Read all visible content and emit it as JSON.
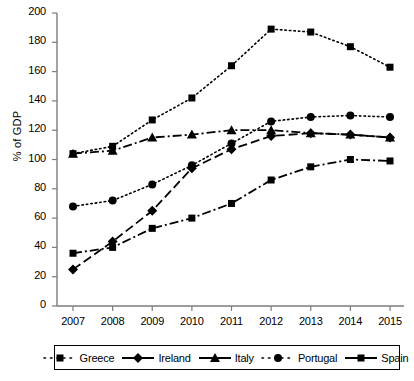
{
  "chart_data": {
    "type": "line",
    "title": "",
    "xlabel": "",
    "ylabel": "% of GDP",
    "x": [
      "2007",
      "2008",
      "2009",
      "2010",
      "2011",
      "2012",
      "2013",
      "2014",
      "2015"
    ],
    "categories": [
      "2007",
      "2008",
      "2009",
      "2010",
      "2011",
      "2012",
      "2013",
      "2014",
      "2015"
    ],
    "ylim": [
      0,
      200
    ],
    "yticks": [
      0,
      20,
      40,
      60,
      80,
      100,
      120,
      140,
      160,
      180,
      200
    ],
    "grid": false,
    "legend_position": "bottom",
    "series": [
      {
        "name": "Greece",
        "marker": "square",
        "line_style": "dotted",
        "color": "#000000",
        "values": [
          104,
          109,
          127,
          142,
          164,
          189,
          187,
          177,
          163
        ]
      },
      {
        "name": "Ireland",
        "marker": "diamond",
        "line_style": "dashed",
        "color": "#000000",
        "values": [
          25,
          44,
          65,
          94,
          107,
          116,
          118,
          117,
          115
        ]
      },
      {
        "name": "Italy",
        "marker": "triangle",
        "line_style": "dash-dot",
        "color": "#000000",
        "values": [
          104,
          106,
          115,
          117,
          120,
          120,
          118,
          117,
          115
        ]
      },
      {
        "name": "Portugal",
        "marker": "circle",
        "line_style": "dotted",
        "color": "#000000",
        "values": [
          68,
          72,
          83,
          96,
          111,
          126,
          129,
          130,
          129
        ]
      },
      {
        "name": "Spain",
        "marker": "square",
        "line_style": "dash-dot",
        "color": "#000000",
        "values": [
          36,
          40,
          53,
          60,
          70,
          86,
          95,
          100,
          99
        ]
      }
    ]
  },
  "axis": {
    "y_label": "% of GDP",
    "y_ticks": [
      "0",
      "20",
      "40",
      "60",
      "80",
      "100",
      "120",
      "140",
      "160",
      "180",
      "200"
    ],
    "x_ticks": [
      "2007",
      "2008",
      "2009",
      "2010",
      "2011",
      "2012",
      "2013",
      "2014",
      "2015"
    ]
  },
  "legend": {
    "items": [
      {
        "label": "Greece",
        "marker": "square",
        "line_style": "dotted"
      },
      {
        "label": "Ireland",
        "marker": "diamond",
        "line_style": "solid"
      },
      {
        "label": "Italy",
        "marker": "triangle",
        "line_style": "solid"
      },
      {
        "label": "Portugal",
        "marker": "circle",
        "line_style": "dotted"
      },
      {
        "label": "Spain",
        "marker": "square",
        "line_style": "solid"
      }
    ]
  }
}
